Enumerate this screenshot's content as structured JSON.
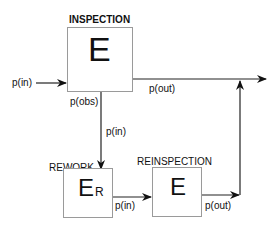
{
  "diagram": {
    "nodes": [
      {
        "id": "inspection",
        "title": "INSPECTION",
        "symbol": "E",
        "subscript": ""
      },
      {
        "id": "rework",
        "title": "REWORK",
        "symbol": "E",
        "subscript": "R"
      },
      {
        "id": "reinspection",
        "title": "REINSPECTION",
        "symbol": "E",
        "subscript": ""
      }
    ],
    "edges": [
      {
        "from": "input",
        "to": "inspection",
        "label": "p(in)"
      },
      {
        "from": "inspection",
        "to": "output",
        "label": "p(out)"
      },
      {
        "from": "inspection",
        "to": "rework",
        "label_top": "p(obs)",
        "label_bottom": "p(in)"
      },
      {
        "from": "rework",
        "to": "reinspection",
        "label": "p(in)"
      },
      {
        "from": "reinspection",
        "to": "output",
        "label": "p(out)"
      }
    ]
  }
}
